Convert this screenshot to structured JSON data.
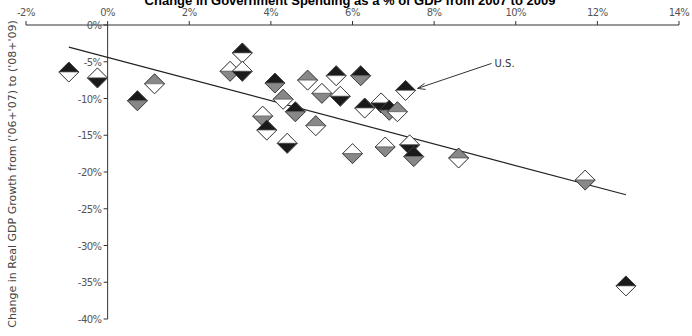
{
  "chart_data": {
    "type": "scatter",
    "title": "Change in Government Spending as a % of GDP from 2007 to 2009",
    "title_visible_fragment": "ge in Government Spending as a % of GDP from 2007 to 2009",
    "xlabel": "",
    "ylabel": "Change in Real GDP Growth from ('06+'07) to ('08+'09)",
    "xlim": [
      -2,
      14
    ],
    "ylim": [
      -40,
      0
    ],
    "x_ticks": [
      "-2%",
      "0%",
      "2%",
      "4%",
      "6%",
      "8%",
      "10%",
      "12%",
      "14%"
    ],
    "y_ticks": [
      "0%",
      "-5%",
      "-10%",
      "-15%",
      "-20%",
      "-25%",
      "-30%",
      "-35%",
      "-40%"
    ],
    "x_axis_position": "top",
    "grid": false,
    "legend": null,
    "marker": "country-flag-diamond",
    "annotations": [
      {
        "text": "U.S.",
        "points_to": {
          "x": 7.3,
          "y": -8.9
        }
      }
    ],
    "trendline": {
      "x": [
        -0.95,
        12.7
      ],
      "y": [
        -3.0,
        -23.1
      ]
    },
    "series": [
      {
        "name": "Countries",
        "points": [
          {
            "x": -0.95,
            "y": -6.4
          },
          {
            "x": -0.25,
            "y": -7.2
          },
          {
            "x": 0.73,
            "y": -10.3
          },
          {
            "x": 1.15,
            "y": -8.0
          },
          {
            "x": 3.0,
            "y": -6.3
          },
          {
            "x": 3.3,
            "y": -3.8
          },
          {
            "x": 3.3,
            "y": -6.3
          },
          {
            "x": 4.1,
            "y": -7.9
          },
          {
            "x": 4.3,
            "y": -10.1
          },
          {
            "x": 3.8,
            "y": -12.4
          },
          {
            "x": 3.9,
            "y": -14.3
          },
          {
            "x": 4.4,
            "y": -16.1
          },
          {
            "x": 4.6,
            "y": -11.8
          },
          {
            "x": 4.9,
            "y": -7.5
          },
          {
            "x": 5.25,
            "y": -9.3
          },
          {
            "x": 5.6,
            "y": -6.9
          },
          {
            "x": 5.7,
            "y": -9.7
          },
          {
            "x": 6.2,
            "y": -6.9
          },
          {
            "x": 5.1,
            "y": -13.7
          },
          {
            "x": 6.0,
            "y": -17.5
          },
          {
            "x": 6.3,
            "y": -11.3
          },
          {
            "x": 6.7,
            "y": -10.6
          },
          {
            "x": 6.9,
            "y": -11.6
          },
          {
            "x": 7.1,
            "y": -11.8
          },
          {
            "x": 6.8,
            "y": -16.6
          },
          {
            "x": 7.3,
            "y": -8.9,
            "label": "U.S."
          },
          {
            "x": 7.4,
            "y": -16.3
          },
          {
            "x": 7.5,
            "y": -17.9
          },
          {
            "x": 8.6,
            "y": -18.1
          },
          {
            "x": 11.7,
            "y": -21.1
          },
          {
            "x": 12.7,
            "y": -35.5
          }
        ]
      }
    ]
  },
  "layout": {
    "plot_left_px": 26,
    "plot_right_px": 679,
    "plot_top_px": 25,
    "plot_bottom_px": 319,
    "x_zero_px": 107,
    "colors": {
      "axis": "#333333",
      "trend": "#222222",
      "marker_dark": "#1a1a1a",
      "marker_light": "#ffffff",
      "marker_mid": "#888888"
    }
  }
}
